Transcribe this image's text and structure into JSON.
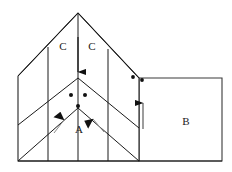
{
  "figure": {
    "type": "line-diagram",
    "background_color": "#ffffff",
    "stroke_color": "#1a1a1a",
    "accent_stroke_color": "#555555",
    "canvas": {
      "width": 232,
      "height": 172
    },
    "labels": [
      {
        "id": "label-c-left",
        "text": "C",
        "x": 63,
        "y": 46
      },
      {
        "id": "label-c-right",
        "text": "C",
        "x": 92,
        "y": 46
      },
      {
        "id": "label-a",
        "text": "A",
        "x": 79,
        "y": 129
      },
      {
        "id": "label-b",
        "text": "B",
        "x": 186,
        "y": 121
      }
    ],
    "outline": {
      "apex": {
        "x": 78,
        "y": 13
      },
      "left_top": {
        "x": 18,
        "y": 76
      },
      "left_bottom": {
        "x": 18,
        "y": 161
      },
      "right_fold": {
        "x": 139,
        "y": 78
      },
      "bottom_right": {
        "x": 222,
        "y": 161
      },
      "right_top": {
        "x": 222,
        "y": 78
      },
      "valley_peak_upper": {
        "x": 78,
        "y": 78
      },
      "valley_peak_lower": {
        "x": 78,
        "y": 108
      },
      "bottom_left": {
        "x": 18,
        "y": 161
      }
    },
    "fold_lines": [
      {
        "id": "fold-upper-left",
        "points": "78,13 18,76"
      },
      {
        "id": "fold-upper-right",
        "points": "78,13 139,78"
      },
      {
        "id": "fold-mid-left",
        "points": "78,78 18,125"
      },
      {
        "id": "fold-mid-right",
        "points": "78,78 139,128"
      },
      {
        "id": "fold-low-left",
        "points": "78,108 18,161"
      },
      {
        "id": "fold-low-right",
        "points": "78,108 139,161"
      }
    ],
    "divider_lines": [
      {
        "id": "divider-left",
        "points": "48,47 48,161"
      },
      {
        "id": "divider-center",
        "points": "78,13 78,161"
      },
      {
        "id": "divider-right",
        "points": "108,49 108,161"
      }
    ],
    "dots": [
      {
        "id": "dot-valley-left",
        "x": 71,
        "y": 95
      },
      {
        "id": "dot-valley-right",
        "x": 85,
        "y": 95
      },
      {
        "id": "dot-valley-low",
        "x": 78,
        "y": 106
      },
      {
        "id": "dot-fold-outer",
        "x": 133,
        "y": 77
      },
      {
        "id": "dot-panel-b-top",
        "x": 142,
        "y": 80
      }
    ],
    "arrows": [
      {
        "id": "arrow-down-center",
        "from": {
          "x": 78,
          "y": 37
        },
        "to": {
          "x": 78,
          "y": 79
        },
        "direction": "down",
        "style": "solid"
      },
      {
        "id": "arrow-up-left",
        "from": {
          "x": 54,
          "y": 133
        },
        "to": {
          "x": 67,
          "y": 116
        },
        "direction": "up-right",
        "style": "tapered"
      },
      {
        "id": "arrow-up-right",
        "from": {
          "x": 104,
          "y": 132
        },
        "to": {
          "x": 89,
          "y": 115
        },
        "direction": "up-left",
        "style": "tapered"
      },
      {
        "id": "arrow-up-panel-b",
        "from": {
          "x": 143,
          "y": 129
        },
        "to": {
          "x": 143,
          "y": 96
        },
        "direction": "up",
        "style": "solid"
      }
    ]
  }
}
